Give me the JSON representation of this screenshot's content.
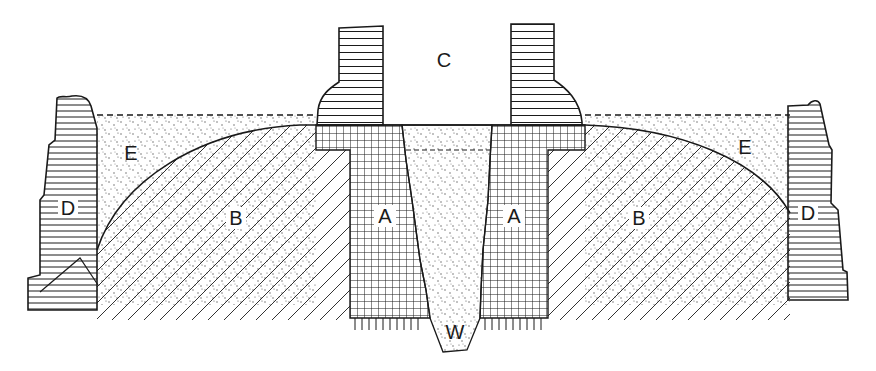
{
  "diagram": {
    "type": "cross-section",
    "labels": {
      "A": "A",
      "B": "B",
      "C": "C",
      "D": "D",
      "E": "E",
      "W": "W"
    },
    "regions": [
      {
        "id": "A",
        "fill": "cross-hatch grid",
        "count": 2
      },
      {
        "id": "B",
        "fill": "diagonal hatch",
        "count": 2
      },
      {
        "id": "C",
        "fill": "open/blank (between horizontal-lined pillars)",
        "count": 1
      },
      {
        "id": "D",
        "fill": "horizontal lines",
        "count": 2
      },
      {
        "id": "E",
        "fill": "stipple (dotted)",
        "count": 2
      },
      {
        "id": "W",
        "fill": "stipple (dotted), tapering wedge",
        "count": 1
      }
    ],
    "colors": {
      "ink": "#1a1a1a",
      "background": "#ffffff"
    }
  }
}
